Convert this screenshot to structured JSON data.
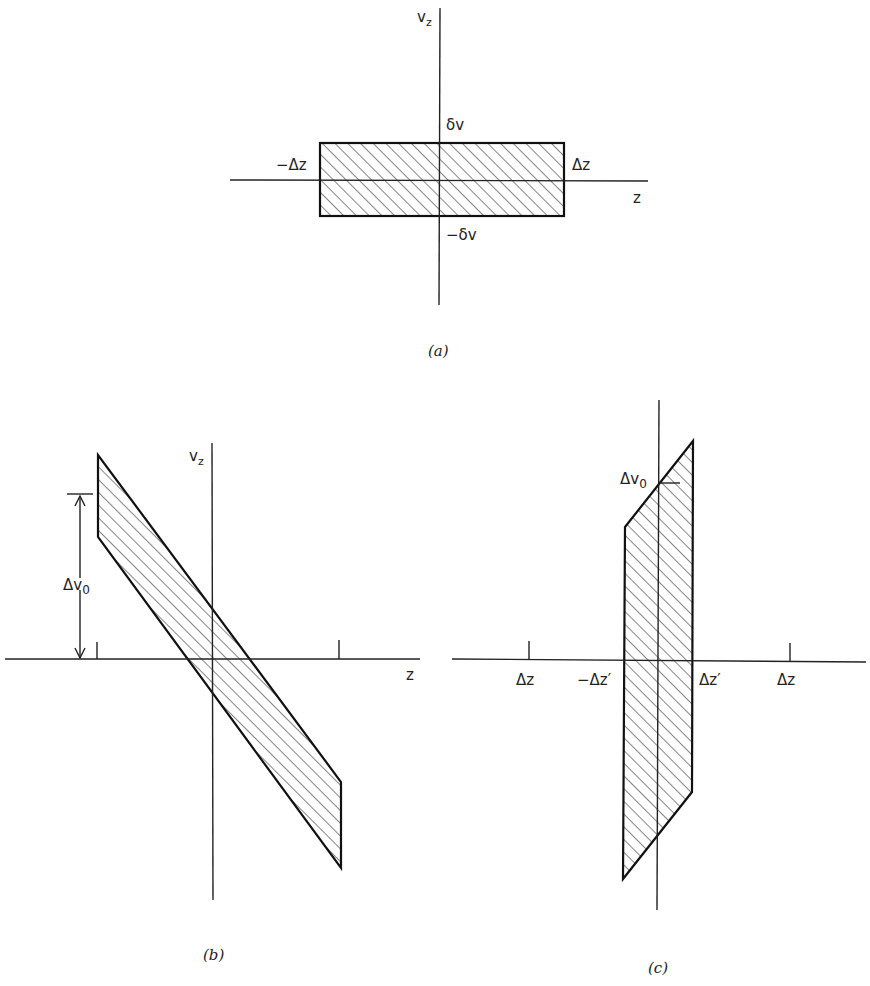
{
  "panel_a": {
    "caption": "(a)",
    "axis_v": "v",
    "axis_v_sub": "z",
    "axis_h": "z",
    "top_label": "δv",
    "bottom_label": "−δv",
    "left_label": "−Δz",
    "right_label": "Δz"
  },
  "panel_b": {
    "caption": "(b)",
    "axis_v": "v",
    "axis_v_sub": "z",
    "axis_h": "z",
    "dim_label": "Δv",
    "dim_sub": "0"
  },
  "panel_c": {
    "caption": "(c)",
    "tick_labels": [
      "Δz",
      "−Δz′",
      "Δz′",
      "Δz"
    ],
    "dim_label": "Δv",
    "dim_sub": "0"
  }
}
